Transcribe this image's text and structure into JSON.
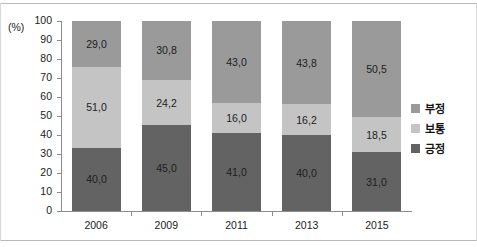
{
  "chart_data": {
    "type": "bar",
    "subtype": "stacked-bar-100",
    "title": "",
    "xlabel": "",
    "ylabel": "",
    "unit_label": "(%)",
    "ylim": [
      0,
      100
    ],
    "yticks": [
      0,
      10,
      20,
      30,
      40,
      50,
      60,
      70,
      80,
      90,
      100
    ],
    "ytick_labels": [
      "0",
      "10",
      "20",
      "30",
      "40",
      "50",
      "60",
      "70",
      "80",
      "90",
      "100"
    ],
    "grid": false,
    "legend_position": "right",
    "categories": [
      "2006",
      "2009",
      "2011",
      "2013",
      "2015"
    ],
    "series": [
      {
        "name": "부정",
        "color": "#9a9a9a",
        "values": [
          29.0,
          30.8,
          43.0,
          43.8,
          50.5
        ],
        "labels": [
          "29,0",
          "30,8",
          "43,0",
          "43,8",
          "50,5"
        ]
      },
      {
        "name": "보통",
        "color": "#c4c4c4",
        "values": [
          51.0,
          24.2,
          16.0,
          16.2,
          18.5
        ],
        "labels": [
          "51,0",
          "24,2",
          "16,0",
          "16,2",
          "18,5"
        ]
      },
      {
        "name": "긍정",
        "color": "#636363",
        "values": [
          40.0,
          45.0,
          41.0,
          40.0,
          31.0
        ],
        "labels": [
          "40,0",
          "45,0",
          "41,0",
          "40,0",
          "31,0"
        ]
      }
    ],
    "stack_order_bottom_to_top": [
      "긍정",
      "보통",
      "부정"
    ]
  },
  "legend": {
    "items": [
      {
        "label": "부정",
        "color": "#9a9a9a"
      },
      {
        "label": "보통",
        "color": "#c4c4c4"
      },
      {
        "label": "긍정",
        "color": "#636363"
      }
    ]
  },
  "axis": {
    "unit": "(%)"
  }
}
